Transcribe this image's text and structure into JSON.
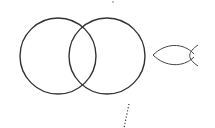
{
  "diagram": {
    "title": "",
    "stroke_color": "#333333",
    "background": "#ffffff",
    "shapes": {
      "left_circle": {
        "cx": 58,
        "cy": 56,
        "r": 38
      },
      "right_circle": {
        "cx": 107,
        "cy": 56,
        "r": 38
      },
      "fish": {
        "x1": 152,
        "x2": 198,
        "cy": 55
      },
      "top_dot": {
        "x": 113,
        "y": 2
      },
      "dotted_line": {
        "x1": 129,
        "y1": 104,
        "x2": 124,
        "y2": 128
      }
    }
  }
}
